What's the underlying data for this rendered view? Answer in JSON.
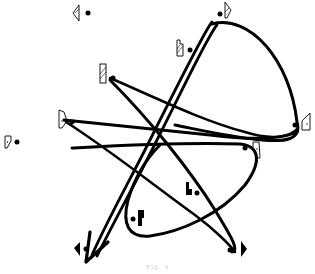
{
  "figure": {
    "caption": "Fig. 3",
    "colors": {
      "ink": "#000000",
      "paper": "#ffffff",
      "caption": "#c8c8c8"
    }
  },
  "markers": [
    {
      "id": "m1",
      "type": "triangle-flag-outline",
      "x": 79,
      "y": 12
    },
    {
      "id": "m2",
      "type": "flag-hatched-top",
      "x": 225,
      "y": 10
    },
    {
      "id": "m3",
      "type": "tall-hatched-notched",
      "x": 179,
      "y": 47
    },
    {
      "id": "m4",
      "type": "tall-hatched",
      "x": 105,
      "y": 72
    },
    {
      "id": "m5",
      "type": "quad-dot",
      "x": 64,
      "y": 118
    },
    {
      "id": "m6",
      "type": "quad-dot",
      "x": 11,
      "y": 140
    },
    {
      "id": "m7",
      "type": "quad-dot-right",
      "x": 307,
      "y": 122
    },
    {
      "id": "m8",
      "type": "quad-dot-right",
      "x": 255,
      "y": 150
    },
    {
      "id": "m9",
      "type": "solid-notched",
      "x": 190,
      "y": 189
    },
    {
      "id": "m10",
      "type": "solid-bar",
      "x": 141,
      "y": 218
    },
    {
      "id": "m11",
      "type": "solid-triangle-left",
      "x": 80,
      "y": 248
    },
    {
      "id": "m12",
      "type": "solid-triangle-right",
      "x": 236,
      "y": 249
    }
  ],
  "paths": [
    {
      "id": "loop-upper-right",
      "description": "teardrop loop from top marker to right marker"
    },
    {
      "id": "double-arrow-diagonal",
      "description": "double-stroke line from top to bottom-left arrowhead"
    },
    {
      "id": "loop-lower-center",
      "description": "elongated loop through center"
    }
  ]
}
